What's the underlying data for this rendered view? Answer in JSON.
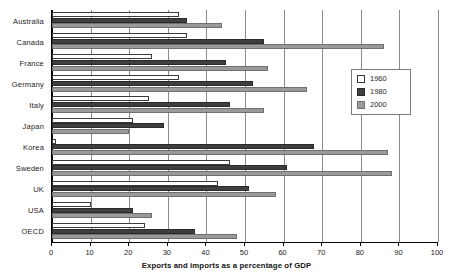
{
  "chart_data": {
    "type": "bar",
    "orientation": "horizontal",
    "title": "",
    "xlabel": "Exports and imports as a percentage of GDP",
    "ylabel": "",
    "xlim": [
      0,
      100
    ],
    "xticks": [
      0,
      10,
      20,
      30,
      40,
      50,
      60,
      70,
      80,
      90,
      100
    ],
    "grid": true,
    "legend_position": "right",
    "categories": [
      "Australia",
      "Canada",
      "France",
      "Germany",
      "Italy",
      "Japan",
      "Korea",
      "Sweden",
      "UK",
      "USA",
      "OECD"
    ],
    "series": [
      {
        "name": "1960",
        "color": "#ffffff",
        "values": [
          33,
          35,
          26,
          33,
          25,
          21,
          1,
          46,
          43,
          10,
          24
        ]
      },
      {
        "name": "1980",
        "color": "#3f3f3f",
        "values": [
          35,
          55,
          45,
          52,
          46,
          29,
          68,
          61,
          51,
          21,
          37
        ]
      },
      {
        "name": "2000",
        "color": "#9a9a9a",
        "values": [
          44,
          86,
          56,
          66,
          55,
          20,
          87,
          88,
          58,
          26,
          48
        ]
      }
    ]
  },
  "legend": {
    "entries": [
      {
        "label": "1960",
        "swatch": "legend-swatch-1960"
      },
      {
        "label": "1980",
        "swatch": "legend-swatch-1980"
      },
      {
        "label": "2000",
        "swatch": "legend-swatch-2000"
      }
    ]
  },
  "axis": {
    "x_title": "Exports and imports as a percentage of GDP",
    "tick_labels": [
      "0",
      "10",
      "20",
      "30",
      "40",
      "50",
      "60",
      "70",
      "80",
      "90",
      "100"
    ]
  }
}
